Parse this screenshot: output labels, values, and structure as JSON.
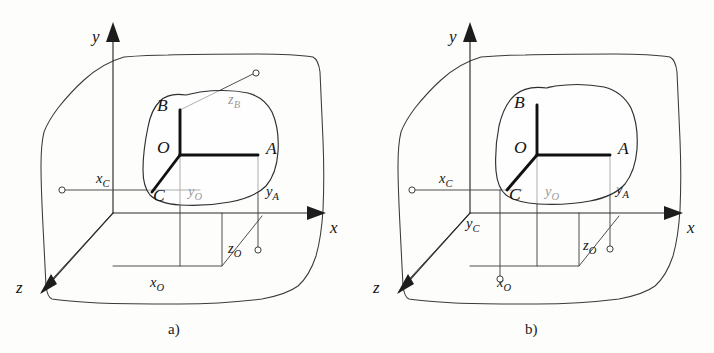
{
  "figure": {
    "background_color": "#fdfdfc",
    "ink_color": "#1d1d1d",
    "bold_ink_color": "#111111",
    "thin_ink_color": "#444444"
  },
  "panels": [
    {
      "id": "a",
      "caption": "a)",
      "axes": [
        {
          "name": "y-axis",
          "label": "y",
          "direction": "up"
        },
        {
          "name": "x-axis",
          "label": "x",
          "direction": "right"
        },
        {
          "name": "z-axis",
          "label": "z",
          "direction": "down-left"
        }
      ],
      "points": [
        {
          "name": "point-O",
          "label": "O"
        },
        {
          "name": "point-A",
          "label": "A"
        },
        {
          "name": "point-B",
          "label": "B"
        },
        {
          "name": "point-C",
          "label": "C"
        }
      ],
      "segments": [
        {
          "name": "segment-xC",
          "base": "x",
          "sub": "C"
        },
        {
          "name": "segment-xO",
          "base": "x",
          "sub": "O"
        },
        {
          "name": "segment-yO",
          "base": "y",
          "sub": "O"
        },
        {
          "name": "segment-yA",
          "base": "y",
          "sub": "A"
        },
        {
          "name": "segment-zO",
          "base": "z",
          "sub": "O"
        },
        {
          "name": "segment-zB",
          "base": "z",
          "sub": "B"
        }
      ]
    },
    {
      "id": "b",
      "caption": "b)",
      "axes": [
        {
          "name": "y-axis",
          "label": "y",
          "direction": "up"
        },
        {
          "name": "x-axis",
          "label": "x",
          "direction": "right"
        },
        {
          "name": "z-axis",
          "label": "z",
          "direction": "down-left"
        }
      ],
      "points": [
        {
          "name": "point-O",
          "label": "O"
        },
        {
          "name": "point-A",
          "label": "A"
        },
        {
          "name": "point-B",
          "label": "B"
        },
        {
          "name": "point-C",
          "label": "C"
        }
      ],
      "segments": [
        {
          "name": "segment-xC",
          "base": "x",
          "sub": "C"
        },
        {
          "name": "segment-xO",
          "base": "x",
          "sub": "O"
        },
        {
          "name": "segment-yO",
          "base": "y",
          "sub": "O"
        },
        {
          "name": "segment-yA",
          "base": "y",
          "sub": "A"
        },
        {
          "name": "segment-yC",
          "base": "y",
          "sub": "C"
        },
        {
          "name": "segment-zO",
          "base": "z",
          "sub": "O"
        }
      ]
    }
  ],
  "labels": {
    "axis_x": "x",
    "axis_y": "y",
    "axis_z": "z",
    "point_O": "O",
    "point_A": "A",
    "point_B": "B",
    "point_C": "C",
    "base_x": "x",
    "base_y": "y",
    "base_z": "z",
    "sub_A": "A",
    "sub_B": "B",
    "sub_C": "C",
    "sub_O": "O",
    "caption_a": "a)",
    "caption_b": "b)"
  }
}
